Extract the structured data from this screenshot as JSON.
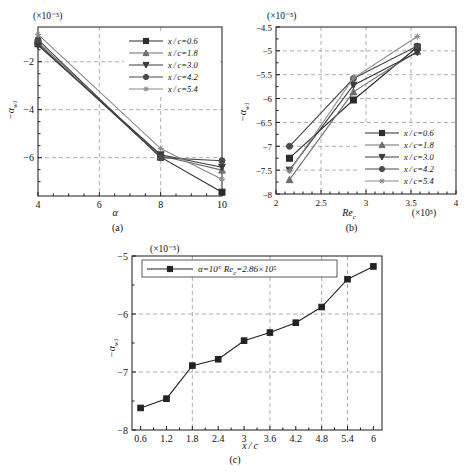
{
  "figure": {
    "panels": [
      "(a)",
      "(b)",
      "(c)"
    ]
  },
  "panel_a": {
    "caption": "(a)",
    "exponent_label": "(×10⁻⁵)",
    "xlabel": "α",
    "ylabel": "−α",
    "ylabel_sub": "w1",
    "xticks": [
      "4",
      "6",
      "8",
      "10"
    ],
    "yticks": [
      "−2",
      "−4",
      "−6"
    ],
    "legend": [
      {
        "label": "x / c=0.6",
        "marker": "square"
      },
      {
        "label": "x / c=1.8",
        "marker": "triangle-up"
      },
      {
        "label": "x / c=3.0",
        "marker": "triangle-down"
      },
      {
        "label": "x / c=4.2",
        "marker": "circle"
      },
      {
        "label": "x / c=5.4",
        "marker": "star"
      }
    ]
  },
  "panel_b": {
    "caption": "(b)",
    "exponent_label": "(×10⁻⁵)",
    "x_exponent_label": "(×10⁵)",
    "xlabel": "Re",
    "xlabel_sub": "c",
    "ylabel": "−α",
    "ylabel_sub": "w1",
    "xticks": [
      "2",
      "2.5",
      "3",
      "3.5",
      "4"
    ],
    "yticks": [
      "−4.5",
      "−5",
      "−5.5",
      "−6",
      "−6.5",
      "−7",
      "−7.5",
      "−8"
    ],
    "legend": [
      {
        "label": "x / c=0.6",
        "marker": "square"
      },
      {
        "label": "x / c=1.8",
        "marker": "triangle-up"
      },
      {
        "label": "x / c=3.0",
        "marker": "triangle-down"
      },
      {
        "label": "x / c=4.2",
        "marker": "circle"
      },
      {
        "label": "x / c=5.4",
        "marker": "star"
      }
    ]
  },
  "panel_c": {
    "caption": "(c)",
    "exponent_label": "(×10⁻⁵)",
    "xlabel": "x / c",
    "ylabel": "−α",
    "ylabel_sub": "w1",
    "xticks": [
      "0.6",
      "1.2",
      "1.8",
      "2.4",
      "3",
      "3.6",
      "4.2",
      "4.8",
      "5.4",
      "6"
    ],
    "yticks": [
      "−5",
      "−6",
      "−7",
      "−8"
    ],
    "legend": [
      {
        "label": "α=10°  Re",
        "label_sub": "c",
        "label_tail": "=2.86×10⁵",
        "marker": "square"
      }
    ]
  },
  "chart_data": [
    {
      "type": "line",
      "panel": "(a)",
      "title": "",
      "xlabel": "α",
      "ylabel": "−αw1 (×10⁻⁵)",
      "xlim": [
        4,
        10
      ],
      "ylim": [
        -7.6,
        -0.55
      ],
      "x": [
        4,
        8,
        10
      ],
      "grid": true,
      "legend_position": "upper-right",
      "series": [
        {
          "name": "x/c=0.6",
          "marker": "square",
          "color": "#2b2b2b",
          "values": [
            -1.25,
            -5.98,
            -7.44
          ]
        },
        {
          "name": "x/c=1.8",
          "marker": "triangle-up",
          "color": "#6e6e6e",
          "values": [
            -1.18,
            -5.92,
            -6.52
          ]
        },
        {
          "name": "x/c=3.0",
          "marker": "triangle-down",
          "color": "#3a3a3a",
          "values": [
            -1.32,
            -5.88,
            -6.4
          ]
        },
        {
          "name": "x/c=4.2",
          "marker": "circle",
          "color": "#4a4a4a",
          "values": [
            -1.08,
            -6.0,
            -6.13
          ]
        },
        {
          "name": "x/c=5.4",
          "marker": "star",
          "color": "#8a8a8a",
          "values": [
            -0.86,
            -5.62,
            -6.9
          ]
        }
      ]
    },
    {
      "type": "line",
      "panel": "(b)",
      "title": "",
      "xlabel": "Rec (×10⁵)",
      "ylabel": "−αw1 (×10⁻⁵)",
      "xlim": [
        2,
        4
      ],
      "ylim": [
        -8,
        -4.5
      ],
      "x": [
        2.15,
        2.86,
        3.57
      ],
      "grid": true,
      "legend_position": "lower-right",
      "series": [
        {
          "name": "x/c=0.6",
          "marker": "square",
          "color": "#2b2b2b",
          "values": [
            -7.25,
            -6.03,
            -4.92
          ]
        },
        {
          "name": "x/c=1.8",
          "marker": "triangle-up",
          "color": "#6e6e6e",
          "values": [
            -7.7,
            -5.86,
            -5.01
          ]
        },
        {
          "name": "x/c=3.0",
          "marker": "triangle-down",
          "color": "#3a3a3a",
          "values": [
            -7.5,
            -5.72,
            -5.03
          ]
        },
        {
          "name": "x/c=4.2",
          "marker": "circle",
          "color": "#4a4a4a",
          "values": [
            -7.0,
            -5.58,
            -4.9
          ]
        },
        {
          "name": "x/c=5.4",
          "marker": "star",
          "color": "#8a8a8a",
          "values": [
            -7.52,
            -5.57,
            -4.7
          ]
        }
      ]
    },
    {
      "type": "line",
      "panel": "(c)",
      "title": "",
      "xlabel": "x / c",
      "ylabel": "−αw1 (×10⁻⁵)",
      "xlim": [
        0.4,
        6.2
      ],
      "ylim": [
        -8,
        -5
      ],
      "grid": true,
      "legend_position": "upper-left",
      "annotation": "α=10°  Rec=2.86×10⁵",
      "x": [
        0.6,
        1.2,
        1.8,
        2.4,
        3.0,
        3.6,
        4.2,
        4.8,
        5.4,
        6.0
      ],
      "series": [
        {
          "name": "α=10° Rec=2.86×10⁵",
          "marker": "square",
          "color": "#222222",
          "values": [
            -7.62,
            -7.46,
            -6.89,
            -6.78,
            -6.46,
            -6.32,
            -6.15,
            -5.88,
            -5.4,
            -5.18
          ]
        }
      ]
    }
  ]
}
